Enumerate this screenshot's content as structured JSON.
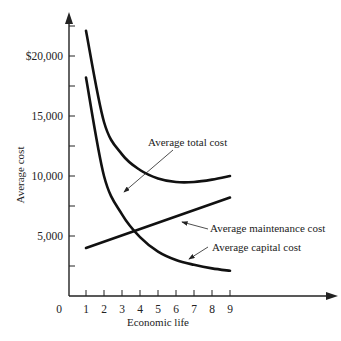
{
  "chart_data": {
    "type": "line",
    "title": "",
    "xlabel": "Economic life",
    "ylabel": "Average cost",
    "x_ticks": [
      "0",
      "1",
      "2",
      "3",
      "4",
      "5",
      "6",
      "7",
      "8",
      "9"
    ],
    "y_ticks": [
      "5,000",
      "10,000",
      "15,000",
      "$20,000"
    ],
    "y_tick_values": [
      5000,
      10000,
      15000,
      20000
    ],
    "xlim": [
      0,
      10
    ],
    "ylim": [
      0,
      24000
    ],
    "grid": false,
    "legend": "annotations with arrows",
    "x": [
      1,
      2,
      3,
      4,
      5,
      6,
      7,
      8,
      9
    ],
    "series": [
      {
        "name": "Average total cost",
        "values": [
          22100,
          14500,
          11800,
          10500,
          9800,
          9500,
          9500,
          9700,
          10000
        ]
      },
      {
        "name": "Average maintenance cost",
        "values": [
          4000,
          4500,
          5000,
          5600,
          6100,
          6600,
          7100,
          7700,
          8200
        ]
      },
      {
        "name": "Average capital cost",
        "values": [
          18200,
          10000,
          6800,
          4900,
          3700,
          3000,
          2600,
          2300,
          2100
        ]
      }
    ],
    "annotations": [
      {
        "text": "Average total cost"
      },
      {
        "text": "Average maintenance cost"
      },
      {
        "text": "Average capital cost"
      }
    ]
  },
  "axes": {
    "x_label": "Economic life",
    "y_label": "Average cost",
    "origin_label": "0"
  }
}
